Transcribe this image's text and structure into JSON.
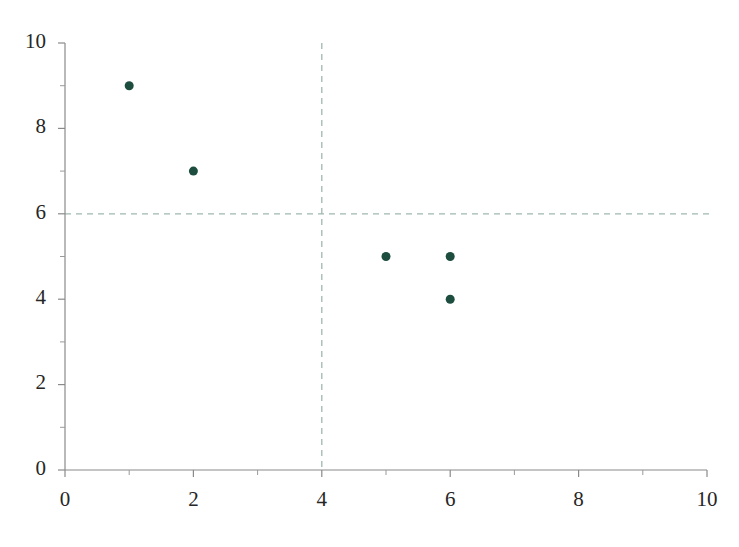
{
  "chart_data": {
    "type": "scatter",
    "title": "",
    "subtitle": "",
    "xlabel": "",
    "ylabel": "",
    "xlim": [
      0,
      10
    ],
    "ylim": [
      0,
      10
    ],
    "grid": false,
    "legend": null,
    "legend_position": "none",
    "x": [
      1,
      2,
      5,
      6,
      6
    ],
    "y": [
      9,
      7,
      5,
      5,
      4
    ],
    "points": [
      {
        "x": 1,
        "y": 9
      },
      {
        "x": 2,
        "y": 7
      },
      {
        "x": 5,
        "y": 5
      },
      {
        "x": 6,
        "y": 5
      },
      {
        "x": 6,
        "y": 4
      }
    ],
    "series": [
      {
        "name": "",
        "x": [
          1,
          2,
          5,
          6,
          6
        ],
        "y": [
          9,
          7,
          5,
          5,
          4
        ],
        "marker_color": "#1d4d3e",
        "marker_size": 9
      }
    ],
    "x_ticks_major": [
      0,
      2,
      4,
      6,
      8,
      10
    ],
    "x_tick_labels": [
      "0",
      "2",
      "4",
      "6",
      "8",
      "10"
    ],
    "x_ticks_minor": [
      1,
      3,
      5,
      7,
      9
    ],
    "y_ticks_major": [
      0,
      2,
      4,
      6,
      8,
      10
    ],
    "y_tick_labels": [
      "0",
      "2",
      "4",
      "6",
      "8",
      "10"
    ],
    "y_ticks_minor": [
      1,
      3,
      5,
      7,
      9
    ],
    "reference_lines": [
      {
        "orientation": "vertical",
        "value": 4,
        "style": "dashed",
        "color": "#9fb8ae"
      },
      {
        "orientation": "horizontal",
        "value": 6,
        "style": "dashed",
        "color": "#9fb8ae"
      }
    ],
    "annotations": []
  },
  "colors": {
    "background": "#ffffff",
    "marker": "#1d4d3e",
    "refline": "#9fb8ae",
    "axis": "#8a8a8a",
    "tick_text": "#262626"
  },
  "geometry": {
    "width": 739,
    "height": 547,
    "plot_left": 65,
    "plot_right": 707,
    "plot_top": 43,
    "plot_bottom": 470,
    "tick_len_major": 7,
    "tick_len_minor": 5,
    "y_label_gap": 12,
    "x_label_gap": 14
  }
}
